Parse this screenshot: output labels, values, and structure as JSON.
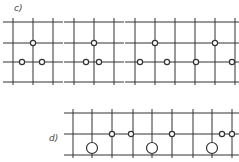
{
  "figure": {
    "sections": [
      {
        "label": "c)",
        "label_pos": [
          14,
          12
        ],
        "panels": [
          {
            "ox": 5,
            "oy": 22,
            "vlines": [
              8,
              28,
              48
            ],
            "hlines": [
              0,
              21,
              40,
              60
            ],
            "small_circles": [
              [
                28,
                21
              ],
              [
                17,
                40
              ],
              [
                37,
                40
              ]
            ],
            "large_circles": []
          },
          {
            "ox": 66,
            "oy": 22,
            "vlines": [
              8,
              28,
              48
            ],
            "hlines": [
              0,
              21,
              40,
              60
            ],
            "small_circles": [
              [
                28,
                21
              ],
              [
                20,
                40
              ],
              [
                33,
                40
              ]
            ],
            "large_circles": []
          },
          {
            "ox": 127,
            "oy": 22,
            "vlines": [
              8,
              28,
              48
            ],
            "hlines": [
              0,
              21,
              40,
              60
            ],
            "small_circles": [
              [
                28,
                21
              ],
              [
                13,
                40
              ],
              [
                40,
                40
              ]
            ],
            "large_circles": []
          },
          {
            "ox": 187,
            "oy": 22,
            "vlines": [
              8,
              28,
              48
            ],
            "hlines": [
              0,
              21,
              40,
              60
            ],
            "small_circles": [
              [
                28,
                21
              ],
              [
                9,
                40
              ],
              [
                45,
                40
              ]
            ],
            "large_circles": []
          }
        ]
      },
      {
        "label": "d)",
        "label_pos": [
          49,
          141
        ],
        "panels": [
          {
            "ox": 66,
            "oy": 113,
            "vlines": [
              7,
              26,
              46
            ],
            "hlines": [
              0,
              21,
              42
            ],
            "small_circles": [
              [
                46,
                21
              ]
            ],
            "large_circles": [
              [
                26,
                35
              ]
            ]
          },
          {
            "ox": 126,
            "oy": 113,
            "vlines": [
              7,
              26,
              46
            ],
            "hlines": [
              0,
              21,
              42
            ],
            "small_circles": [
              [
                5,
                21
              ],
              [
                46,
                21
              ]
            ],
            "large_circles": [
              [
                26,
                35
              ]
            ]
          },
          {
            "ox": 186,
            "oy": 113,
            "vlines": [
              7,
              26,
              46
            ],
            "hlines": [
              0,
              21,
              42
            ],
            "small_circles": [
              [
                36,
                21
              ],
              [
                46,
                21
              ]
            ],
            "large_circles": [
              [
                26,
                35
              ]
            ]
          }
        ]
      }
    ],
    "colors": {
      "line": "#333333",
      "circle_fill": "#ffffff"
    }
  }
}
